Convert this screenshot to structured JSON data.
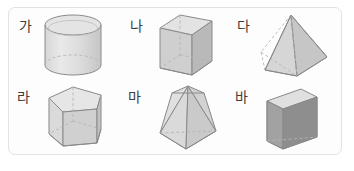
{
  "panel": {
    "border_color": "#e2e2e2",
    "background_color": "#fdfdfd",
    "corner_radius_px": 7
  },
  "diagram": {
    "title": "",
    "type": "geometric-solids-grid",
    "rows": 2,
    "columns": 3,
    "label_color": "#3c3c3c",
    "palette": {
      "outline": "#8a8a8a",
      "hidden_edge": "#b4b4b4",
      "face_light": "#e8e8e8",
      "face_mid": "#d2d2d2",
      "face_dark": "#9d9d9d",
      "face_darker": "#8b8b8b"
    },
    "items": [
      {
        "label": "가",
        "shape": "cylinder",
        "shape_name": "cylinder",
        "row": 0,
        "column": 0
      },
      {
        "label": "나",
        "shape": "rectangular-prism",
        "shape_name": "cuboid",
        "row": 0,
        "column": 1
      },
      {
        "label": "다",
        "shape": "square-pyramid",
        "shape_name": "square pyramid",
        "row": 0,
        "column": 2
      },
      {
        "label": "라",
        "shape": "pentagonal-prism",
        "shape_name": "pentagonal prism",
        "row": 1,
        "column": 0
      },
      {
        "label": "마",
        "shape": "pentagonal-pyramid",
        "shape_name": "pentagonal pyramid",
        "row": 1,
        "column": 1
      },
      {
        "label": "바",
        "shape": "triangular-prism",
        "shape_name": "triangular prism",
        "row": 1,
        "column": 2
      }
    ]
  }
}
